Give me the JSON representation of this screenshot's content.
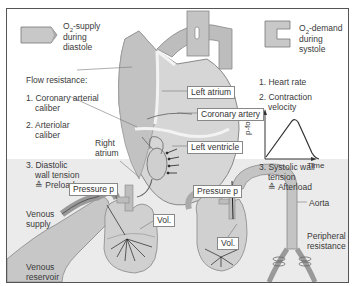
{
  "top_left": {
    "o2_supply_prefix": "O",
    "o2_supply_sub": "2",
    "o2_supply_rest": "-supply",
    "o2_supply_line2": "during",
    "o2_supply_line3": "diastole"
  },
  "top_right": {
    "o2_demand_prefix": "O",
    "o2_demand_sub": "2",
    "o2_demand_rest": "-demand",
    "o2_demand_line2": "during",
    "o2_demand_line3": "systole"
  },
  "left_list": {
    "heading": "Flow resistance:",
    "item1_line1": "1. Coronary arterial",
    "item1_line2": "caliber",
    "item2_line1": "2. Arteriolar",
    "item2_line2": "caliber",
    "item3_line1": "3. Diastolic",
    "item3_line2": "wall tension",
    "item3_line3": "≙ Preload"
  },
  "right_list": {
    "item1": "1. Heart rate",
    "item2_line1": "2. Contraction",
    "item2_line2": "velocity",
    "item3_line1": "3. Systolic wall",
    "item3_line2": "tension",
    "item3_line3": "≙ Afterload"
  },
  "heart_labels": {
    "left_atrium": "Left atrium",
    "coronary_artery": "Coronary artery",
    "left_ventricle": "Left ventricle",
    "right_atrium_line1": "Right",
    "right_atrium_line2": "atrium"
  },
  "mini_chart": {
    "ylabel": "p-force",
    "xlabel": "Time"
  },
  "lower_left": {
    "pressure": "Pressure p",
    "vol": "Vol.",
    "venous_supply_line1": "Venous",
    "venous_supply_line2": "supply",
    "venous_reservoir_line1": "Venous",
    "venous_reservoir_line2": "reservoir"
  },
  "lower_right": {
    "pressure": "Pressure p",
    "vol": "Vol.",
    "aorta": "Aorta",
    "peripheral_line1": "Peripheral",
    "peripheral_line2": "resistance"
  }
}
